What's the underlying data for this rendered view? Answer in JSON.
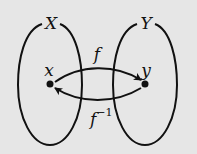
{
  "diagram": {
    "sets": [
      {
        "name": "X"
      },
      {
        "name": "Y"
      }
    ],
    "points": [
      {
        "label": "x"
      },
      {
        "label": "y"
      }
    ],
    "arrows": [
      {
        "label": "f",
        "from": "x",
        "to": "y"
      },
      {
        "label": "f",
        "superscript": "−1",
        "from": "y",
        "to": "x"
      }
    ]
  }
}
